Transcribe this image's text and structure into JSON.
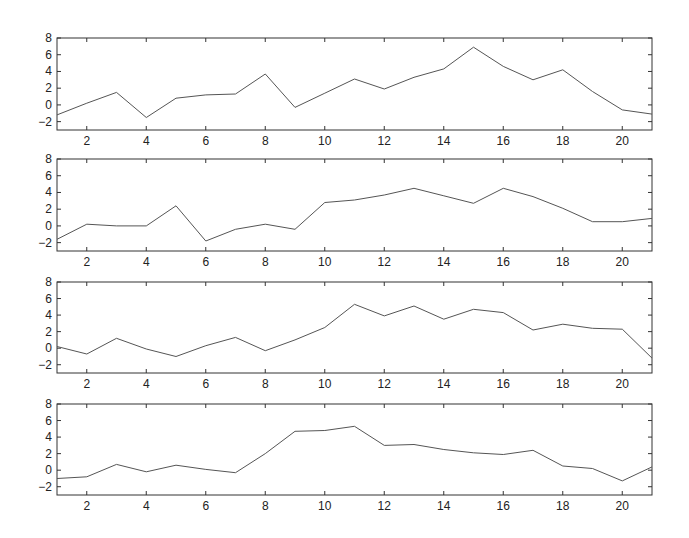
{
  "chart_data": [
    {
      "type": "line",
      "title": "",
      "xlabel": "",
      "ylabel": "",
      "x": [
        1,
        2,
        3,
        4,
        5,
        6,
        7,
        8,
        9,
        10,
        11,
        12,
        13,
        14,
        15,
        16,
        17,
        18,
        19,
        20,
        21
      ],
      "values": [
        -1.2,
        0.2,
        1.5,
        -1.5,
        0.8,
        1.2,
        1.3,
        3.7,
        -0.3,
        1.4,
        3.1,
        1.9,
        3.3,
        4.3,
        6.9,
        4.6,
        3.0,
        4.2,
        1.6,
        -0.6,
        -1.1
      ],
      "xlim": [
        1,
        21
      ],
      "ylim": [
        -3,
        8
      ],
      "xticks": [
        2,
        4,
        6,
        8,
        10,
        12,
        14,
        16,
        18,
        20
      ],
      "yticks": [
        -2,
        0,
        2,
        4,
        6,
        8
      ],
      "grid": false
    },
    {
      "type": "line",
      "title": "",
      "xlabel": "",
      "ylabel": "",
      "x": [
        1,
        2,
        3,
        4,
        5,
        6,
        7,
        8,
        9,
        10,
        11,
        12,
        13,
        14,
        15,
        16,
        17,
        18,
        19,
        20,
        21
      ],
      "values": [
        -1.6,
        0.2,
        0.0,
        0.0,
        2.4,
        -1.8,
        -0.4,
        0.2,
        -0.4,
        2.8,
        3.1,
        3.7,
        4.5,
        3.6,
        2.7,
        4.5,
        3.5,
        2.1,
        0.5,
        0.5,
        0.9
      ],
      "xlim": [
        1,
        21
      ],
      "ylim": [
        -3,
        8
      ],
      "xticks": [
        2,
        4,
        6,
        8,
        10,
        12,
        14,
        16,
        18,
        20
      ],
      "yticks": [
        -2,
        0,
        2,
        4,
        6,
        8
      ],
      "grid": false
    },
    {
      "type": "line",
      "title": "",
      "xlabel": "",
      "ylabel": "",
      "x": [
        1,
        2,
        3,
        4,
        5,
        6,
        7,
        8,
        9,
        10,
        11,
        12,
        13,
        14,
        15,
        16,
        17,
        18,
        19,
        20,
        21
      ],
      "values": [
        0.2,
        -0.7,
        1.2,
        -0.1,
        -1.0,
        0.3,
        1.3,
        -0.3,
        1.0,
        2.5,
        5.3,
        3.9,
        5.1,
        3.5,
        4.7,
        4.3,
        2.2,
        2.9,
        2.4,
        2.3,
        -1.2
      ],
      "xlim": [
        1,
        21
      ],
      "ylim": [
        -3,
        8
      ],
      "xticks": [
        2,
        4,
        6,
        8,
        10,
        12,
        14,
        16,
        18,
        20
      ],
      "yticks": [
        -2,
        0,
        2,
        4,
        6,
        8
      ],
      "grid": false
    },
    {
      "type": "line",
      "title": "",
      "xlabel": "",
      "ylabel": "",
      "x": [
        1,
        2,
        3,
        4,
        5,
        6,
        7,
        8,
        9,
        10,
        11,
        12,
        13,
        14,
        15,
        16,
        17,
        18,
        19,
        20,
        21
      ],
      "values": [
        -1.0,
        -0.8,
        0.7,
        -0.2,
        0.6,
        0.1,
        -0.3,
        2.0,
        4.7,
        4.8,
        5.3,
        3.0,
        3.1,
        2.5,
        2.1,
        1.9,
        2.4,
        0.5,
        0.2,
        -1.3,
        0.4
      ],
      "xlim": [
        1,
        21
      ],
      "ylim": [
        -3,
        8
      ],
      "xticks": [
        2,
        4,
        6,
        8,
        10,
        12,
        14,
        16,
        18,
        20
      ],
      "yticks": [
        -2,
        0,
        2,
        4,
        6,
        8
      ],
      "grid": false
    }
  ],
  "style": {
    "line_color": "#555555",
    "axis_color": "#333333",
    "background": "#ffffff"
  }
}
